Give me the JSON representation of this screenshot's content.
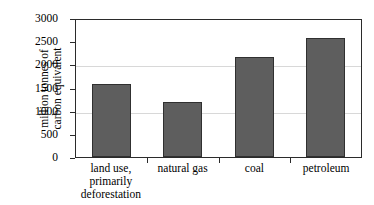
{
  "chart_data": {
    "type": "bar",
    "title": "",
    "xlabel": "",
    "ylabel_lines": [
      "million tonnes of",
      "carbon equivalent"
    ],
    "ylabel": "million tonnes of carbon equivalent",
    "categories": [
      [
        "land use,",
        "primarily",
        "deforestation"
      ],
      [
        "natural gas"
      ],
      [
        "coal"
      ],
      [
        "petroleum"
      ]
    ],
    "category_names": [
      "land use, primarily deforestation",
      "natural gas",
      "coal",
      "petroleum"
    ],
    "values": [
      1600,
      1200,
      2200,
      2600
    ],
    "ylim": [
      0,
      3000
    ],
    "yticks": [
      3000,
      2500,
      2000,
      1500,
      1000,
      500,
      0
    ],
    "ytick_labels": [
      "3000",
      "2500",
      "2000",
      "1500",
      "1000",
      "500",
      "0"
    ],
    "gridlines_at": [
      1000,
      2000
    ],
    "grid": true,
    "legend": "none",
    "colors": {
      "bar_fill": "#5e5e5e",
      "bar_border": "#303030",
      "axis": "#2b2b2b",
      "gridline": "#d8d8d8",
      "background": "#ffffff",
      "text": "#000000"
    }
  }
}
